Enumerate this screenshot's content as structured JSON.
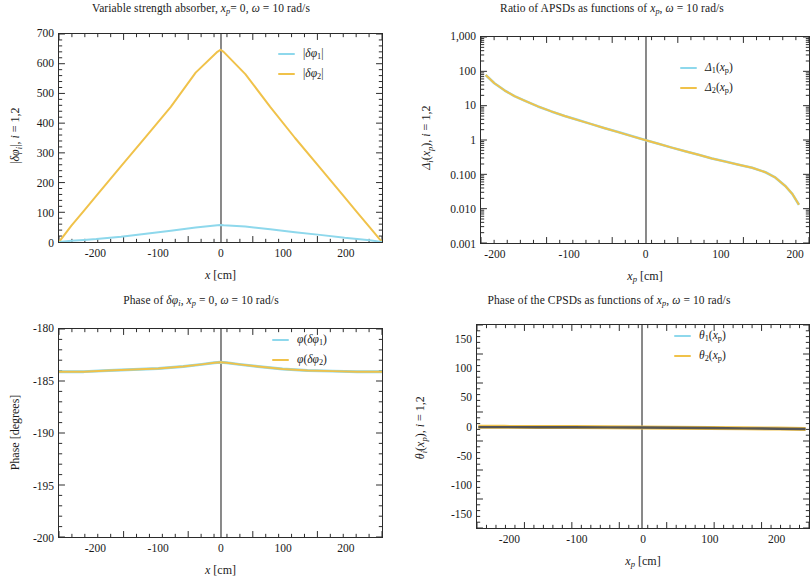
{
  "figure": {
    "colors": {
      "series1": "#8ed8ec",
      "series2": "#f0c24a",
      "axis": "#2b2b2b",
      "zeroline": "#3a3a3a"
    }
  },
  "panels": [
    {
      "id": "top-left",
      "title": "Variable strength absorber, x_p= 0, ω = 10 rad/s",
      "xlabel": "x [cm]",
      "ylabel": "|δϕ_i|, i = 1,2",
      "xticks": [
        "-200",
        "-100",
        "0",
        "100",
        "200"
      ],
      "yticks": [
        "700",
        "600",
        "500",
        "400",
        "300",
        "200",
        "100",
        "0"
      ],
      "legend": [
        "|δϕ₁|",
        "|δϕ₂|"
      ]
    },
    {
      "id": "top-right",
      "title": "Ratio of APSDs as functions of x_p, ω = 10 rad/s",
      "xlabel": "x_p [cm]",
      "ylabel": "Δ_i(x_p), i = 1,2",
      "xticks": [
        "-200",
        "-100",
        "0",
        "100",
        "200"
      ],
      "yticks": [
        "1,000",
        "100",
        "10",
        "1",
        "0.100",
        "0.010",
        "0.001"
      ],
      "legend": [
        "Δ₁(x_p)",
        "Δ₂(x_p)"
      ]
    },
    {
      "id": "bottom-left",
      "title": "Phase of δϕ_i, x_p = 0, ω = 10 rad/s",
      "xlabel": "x [cm]",
      "ylabel": "Phase [degrees]",
      "xticks": [
        "-200",
        "-100",
        "0",
        "100",
        "200"
      ],
      "yticks": [
        "-180",
        "-185",
        "-190",
        "-195",
        "-200"
      ],
      "legend": [
        "φ(δϕ₁)",
        "φ(δϕ₂)"
      ]
    },
    {
      "id": "bottom-right",
      "title": "Phase of the CPSDs as functions of x_p, ω = 10 rad/s",
      "xlabel": "x_p [cm]",
      "ylabel": "θ_i(x_p), i = 1,2",
      "xticks": [
        "-200",
        "-100",
        "0",
        "100",
        "200"
      ],
      "yticks": [
        "150",
        "100",
        "50",
        "0",
        "-50",
        "-100",
        "-150"
      ],
      "legend": [
        "θ₁(x_p)",
        "θ₂(x_p)"
      ]
    }
  ],
  "chart_data": [
    {
      "type": "line",
      "panel": "top-left",
      "title": "Variable strength absorber, x_p = 0, ω = 10 rad/s",
      "xlabel": "x [cm]",
      "ylabel": "|δϕ_i|, i = 1,2",
      "xlim": [
        -260,
        260
      ],
      "ylim": [
        0,
        700
      ],
      "grid": false,
      "legend_position": "top-right",
      "x": [
        -260,
        -240,
        -220,
        -200,
        -160,
        -120,
        -80,
        -40,
        -5,
        0,
        5,
        40,
        80,
        120,
        160,
        200,
        220,
        240,
        260
      ],
      "series": [
        {
          "name": "|δϕ₁|",
          "color": "#8ed8ec",
          "values": [
            0,
            4,
            7,
            10,
            18,
            28,
            38,
            49,
            56,
            57,
            56,
            52,
            43,
            33,
            24,
            14,
            10,
            6,
            0
          ]
        },
        {
          "name": "|δϕ₂|",
          "color": "#f0c24a",
          "values": [
            0,
            55,
            105,
            155,
            255,
            355,
            455,
            570,
            640,
            647,
            640,
            565,
            455,
            350,
            250,
            150,
            100,
            50,
            0
          ]
        }
      ]
    },
    {
      "type": "line",
      "panel": "top-right",
      "title": "Ratio of APSDs as functions of x_p, ω = 10 rad/s",
      "xlabel": "x_p [cm]",
      "ylabel": "Δ_i(x_p), i = 1,2",
      "xlim": [
        -245,
        245
      ],
      "ylim": [
        0.001,
        1000
      ],
      "yscale": "log",
      "grid": false,
      "legend_position": "top-right",
      "x": [
        -238,
        -225,
        -210,
        -195,
        -180,
        -160,
        -140,
        -120,
        -100,
        -80,
        -60,
        -40,
        -20,
        0,
        20,
        40,
        60,
        80,
        100,
        120,
        140,
        160,
        180,
        195,
        210,
        220,
        230
      ],
      "series": [
        {
          "name": "Δ₁(x_p)",
          "color": "#8ed8ec",
          "values": [
            78,
            45,
            28,
            19,
            14,
            9.5,
            6.8,
            5.0,
            3.8,
            2.9,
            2.2,
            1.7,
            1.3,
            1.0,
            0.78,
            0.6,
            0.47,
            0.37,
            0.29,
            0.235,
            0.19,
            0.155,
            0.115,
            0.08,
            0.045,
            0.027,
            0.013
          ]
        },
        {
          "name": "Δ₂(x_p)",
          "color": "#f0c24a",
          "values": [
            78,
            45,
            28,
            19,
            14,
            9.5,
            6.8,
            5.0,
            3.8,
            2.9,
            2.2,
            1.7,
            1.3,
            1.0,
            0.78,
            0.6,
            0.47,
            0.37,
            0.29,
            0.235,
            0.19,
            0.155,
            0.115,
            0.08,
            0.045,
            0.027,
            0.013
          ]
        }
      ]
    },
    {
      "type": "line",
      "panel": "bottom-left",
      "title": "Phase of δϕ_i, x_p = 0, ω = 10 rad/s",
      "xlabel": "x [cm]",
      "ylabel": "Phase [degrees]",
      "xlim": [
        -260,
        260
      ],
      "ylim": [
        -200,
        -180
      ],
      "grid": false,
      "legend_position": "top-right",
      "x": [
        -260,
        -220,
        -180,
        -140,
        -100,
        -60,
        -30,
        -10,
        0,
        10,
        30,
        60,
        100,
        140,
        180,
        220,
        260
      ],
      "series": [
        {
          "name": "φ(δϕ₁)",
          "color": "#8ed8ec",
          "values": [
            -184.1,
            -184.1,
            -184.0,
            -183.9,
            -183.8,
            -183.6,
            -183.4,
            -183.25,
            -183.2,
            -183.25,
            -183.4,
            -183.6,
            -183.85,
            -184.0,
            -184.05,
            -184.1,
            -184.1
          ]
        },
        {
          "name": "φ(δϕ₂)",
          "color": "#f0c24a",
          "values": [
            -184.1,
            -184.1,
            -184.0,
            -183.9,
            -183.8,
            -183.6,
            -183.4,
            -183.25,
            -183.2,
            -183.25,
            -183.4,
            -183.6,
            -183.85,
            -184.0,
            -184.05,
            -184.1,
            -184.1
          ]
        }
      ]
    },
    {
      "type": "line",
      "panel": "bottom-right",
      "title": "Phase of the CPSDs as functions of x_p, ω = 10 rad/s",
      "xlabel": "x_p [cm]",
      "ylabel": "θ_i(x_p), i = 1,2",
      "xlim": [
        -240,
        245
      ],
      "ylim": [
        -175,
        175
      ],
      "grid": false,
      "legend_position": "top-right",
      "x": [
        -238,
        -200,
        -150,
        -100,
        -50,
        0,
        50,
        100,
        150,
        200,
        240
      ],
      "series": [
        {
          "name": "θ₁(x_p)",
          "color": "#8ed8ec",
          "values": [
            -1.0,
            -1.0,
            -1.2,
            -1.4,
            -1.6,
            -1.8,
            -2.2,
            -2.6,
            -3.2,
            -3.8,
            -4.4
          ]
        },
        {
          "name": "θ₂(x_p)",
          "color": "#f0c24a",
          "values": [
            -0.5,
            -0.6,
            -0.8,
            -1.0,
            -1.3,
            -1.6,
            -2.0,
            -2.4,
            -3.0,
            -3.6,
            -4.2
          ]
        }
      ]
    }
  ]
}
